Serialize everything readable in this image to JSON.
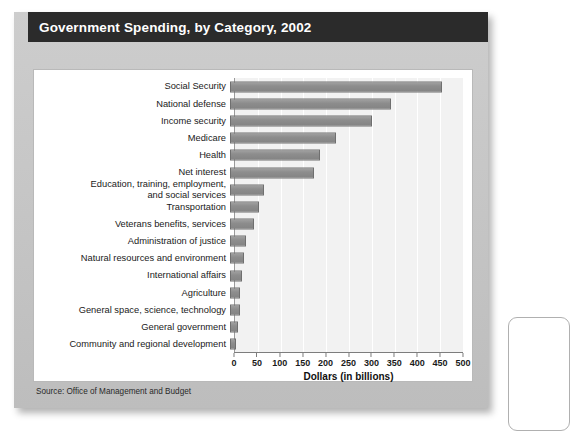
{
  "title": "Government Spending, by Category, 2002",
  "source_note": "Source: Office of Management and Budget",
  "chart_data": {
    "type": "bar",
    "orientation": "horizontal",
    "title": "Government Spending, by Category, 2002",
    "xlabel": "Dollars (in billions)",
    "ylabel": "",
    "xlim": [
      0,
      500
    ],
    "xticks": [
      0,
      50,
      100,
      150,
      200,
      250,
      300,
      350,
      400,
      450,
      500
    ],
    "grid": true,
    "legend": null,
    "categories": [
      "Social Security",
      "National defense",
      "Income security",
      "Medicare",
      "Health",
      "Net interest",
      "Education, training, employment,\nand social services",
      "Transportation",
      "Veterans benefits, services",
      "Administration of justice",
      "Natural resources and environment",
      "International affairs",
      "Agriculture",
      "General space,  science, technology",
      "General government",
      "Community and regional development"
    ],
    "values": [
      455,
      345,
      305,
      228,
      193,
      181,
      72,
      62,
      51,
      35,
      30,
      25,
      22,
      21,
      17,
      13
    ],
    "bar_color": "#8d8d8d",
    "bar_border_color": "#6f6f6f"
  }
}
